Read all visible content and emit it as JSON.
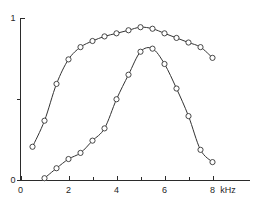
{
  "chart_data": {
    "type": "line",
    "title": "",
    "subtitle": "",
    "xlabel": "kHz",
    "ylabel": "",
    "xlim": [
      0,
      9.6
    ],
    "ylim": [
      0,
      1.06
    ],
    "grid": false,
    "legend": "none",
    "markers": "open-circle",
    "x_ticks_major": [
      0,
      2,
      4,
      6,
      8
    ],
    "x_tick_labels": [
      "0",
      "2",
      "4",
      "6",
      "8"
    ],
    "x_ticks_minor": [
      1,
      3,
      5,
      7
    ],
    "y_ticks_major": [
      0,
      0.5,
      1
    ],
    "y_tick_labels": [
      "0",
      "",
      "1"
    ],
    "series": [
      {
        "name": "upper-curve",
        "x": [
          0.5,
          1.0,
          1.5,
          2.0,
          2.5,
          3.0,
          3.5,
          4.0,
          4.5,
          5.0,
          5.5,
          6.0,
          6.5,
          7.0,
          7.5,
          8.0
        ],
        "values": [
          0.22,
          0.39,
          0.63,
          0.79,
          0.87,
          0.91,
          0.94,
          0.96,
          0.98,
          1.0,
          0.99,
          0.96,
          0.93,
          0.9,
          0.87,
          0.8
        ]
      },
      {
        "name": "lower-curve",
        "x": [
          1.0,
          1.5,
          2.0,
          2.5,
          3.0,
          3.5,
          4.0,
          4.5,
          5.0,
          5.5,
          6.0,
          6.5,
          7.0,
          7.5,
          8.0
        ],
        "values": [
          0.015,
          0.08,
          0.14,
          0.18,
          0.26,
          0.34,
          0.53,
          0.69,
          0.84,
          0.86,
          0.76,
          0.6,
          0.42,
          0.2,
          0.12
        ]
      }
    ]
  },
  "axis": {
    "x_title": "kHz",
    "y_top_label": "1",
    "y_bottom_label": "0",
    "x_origin_label": "0"
  },
  "colors": {
    "axis": "#2b2b2b",
    "curve": "#333333",
    "marker_fill": "#ffffff",
    "background": "#ffffff"
  }
}
